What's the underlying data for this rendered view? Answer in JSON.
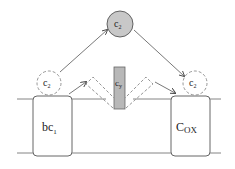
{
  "diagram": {
    "colors": {
      "line": "#555555",
      "membrane_line": "#666666",
      "cyt_fill": "#c8c8c8",
      "cy_fill": "#b8b8b8",
      "dashed": "#8a8a8a",
      "background": "#ffffff"
    },
    "nodes": {
      "c2_soluble": {
        "label": "c",
        "sub": "2",
        "shape": "circle-filled"
      },
      "c2_left": {
        "label": "c",
        "sub": "2",
        "shape": "circle-dashed"
      },
      "c2_right": {
        "label": "c",
        "sub": "2",
        "shape": "circle-dashed"
      },
      "cy": {
        "label": "c",
        "sub": "y",
        "shape": "membrane-anchored-bar"
      },
      "bc1": {
        "label": "bc",
        "sub": "1",
        "shape": "rounded-box"
      },
      "cox": {
        "label": "C",
        "sub": "OX",
        "shape": "rounded-box"
      }
    },
    "edges": [
      {
        "from": "c2_left",
        "to": "c2_soluble",
        "style": "arrow"
      },
      {
        "from": "c2_soluble",
        "to": "c2_right",
        "style": "arrow"
      },
      {
        "from": "bc1",
        "to": "cy_left_position",
        "style": "arrow"
      },
      {
        "from": "cy_right_position",
        "to": "cox",
        "style": "arrow"
      }
    ],
    "membrane": {
      "description": "two horizontal lines representing the membrane bilayer"
    }
  }
}
